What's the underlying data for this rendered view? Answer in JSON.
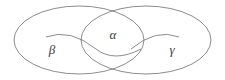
{
  "figure": {
    "background_color": "#ffffff",
    "stroke_color": "#6e6e6e",
    "label_color": "#3a3a3a",
    "stroke_width": 0.8
  },
  "regions": [
    {
      "id": "left",
      "label": "β",
      "name": "beta",
      "label_x": 52,
      "label_y": 50,
      "ellipse": {
        "cx": 79,
        "cy": 40,
        "rx": 65,
        "ry": 34
      }
    },
    {
      "id": "right",
      "label": "γ",
      "name": "gamma",
      "label_x": 172,
      "label_y": 50,
      "ellipse": {
        "cx": 146,
        "cy": 40,
        "rx": 65,
        "ry": 34
      }
    },
    {
      "id": "intersection",
      "label": "α",
      "name": "alpha",
      "label_x": 113,
      "label_y": 36,
      "ellipse": null
    }
  ],
  "inner_arcs": [
    {
      "id": "left-inner-arc",
      "name": "beta-inner-arc",
      "path": "M 46 37 Q 70 28 96 48 Q 118 62 140 48"
    },
    {
      "id": "right-inner-arc",
      "name": "gamma-inner-arc",
      "path": "M 179 37 Q 156 28 131 48"
    }
  ]
}
